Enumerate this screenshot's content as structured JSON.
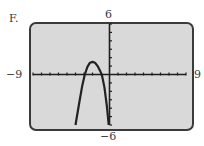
{
  "panel_label": "F.",
  "window": {
    "xmin": -9,
    "xmax": 9,
    "ymin": -6,
    "ymax": 6,
    "xmin_label": "−9",
    "xmax_label": "9",
    "ymin_label": "−6",
    "ymax_label": "6",
    "xscl": 1,
    "yscl": 1
  },
  "colors": {
    "screen_bg": "#d9d9d9",
    "border": "#3a3a3a",
    "curve": "#222222"
  },
  "chart_data": {
    "type": "line",
    "title": "F.",
    "xlabel": "",
    "ylabel": "",
    "xlim": [
      -9,
      9
    ],
    "ylim": [
      -6,
      6
    ],
    "grid": false,
    "legend": null,
    "annotations": [
      "x-axis and y-axis with unit tick marks"
    ],
    "series": [
      {
        "name": "graph",
        "x": [
          -4.0,
          -3.6,
          -3.2,
          -2.9,
          -2.6,
          -2.3,
          -2.0,
          -1.7,
          -1.4,
          -1.1,
          -0.9,
          -0.6,
          -0.3,
          -0.1
        ],
        "y": [
          -6.0,
          -3.6,
          -1.3,
          0.0,
          0.9,
          1.4,
          1.5,
          1.4,
          1.0,
          0.4,
          0.0,
          -1.5,
          -3.8,
          -6.0
        ]
      }
    ]
  }
}
